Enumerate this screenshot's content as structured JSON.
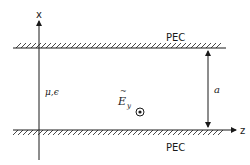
{
  "diagram": {
    "axes": {
      "vertical_label": "x",
      "horizontal_label": "z"
    },
    "top_plate": {
      "label": "PEC"
    },
    "bottom_plate": {
      "label": "PEC"
    },
    "medium_label": "μ,ϵ",
    "field": {
      "symbol": "E",
      "tilde": "~",
      "subscript": "y",
      "direction_icon": "out-of-page-icon"
    },
    "separation_label": "a",
    "colors": {
      "line": "#1a1a1a",
      "background": "#ffffff"
    }
  }
}
